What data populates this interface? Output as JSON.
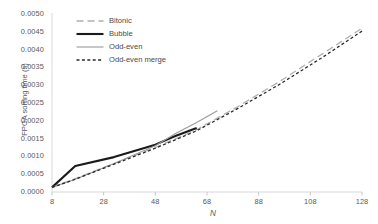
{
  "chart_data": {
    "type": "line",
    "title": "",
    "xlabel": "N",
    "ylabel": "FPGA sorting time (s)",
    "xlim": [
      8,
      128
    ],
    "ylim": [
      0.0,
      0.005
    ],
    "xticks": [
      8,
      28,
      48,
      68,
      88,
      108,
      128
    ],
    "xtick_labels": [
      "8",
      "28",
      "48",
      "68",
      "88",
      "108",
      "128"
    ],
    "yticks": [
      0.0,
      0.0005,
      0.001,
      0.0015,
      0.002,
      0.0025,
      0.003,
      0.0035,
      0.004,
      0.0045,
      0.005
    ],
    "ytick_labels": [
      "0.0000",
      "0.0005",
      "0.0010",
      "0.0015",
      "0.0020",
      "0.0025",
      "0.0030",
      "0.0035",
      "0.0040",
      "0.0045",
      "0.0050"
    ],
    "grid": false,
    "legend_position": "top-left-inside",
    "series": [
      {
        "name": "Bitonic",
        "style": "dashed",
        "color": "#b0b0b0",
        "width": 1.3,
        "x": [
          8,
          16,
          32,
          48,
          64,
          80,
          96,
          112,
          128
        ],
        "y": [
          0.00013,
          0.00035,
          0.0008,
          0.00125,
          0.00175,
          0.0024,
          0.0031,
          0.00385,
          0.0046
        ]
      },
      {
        "name": "Bubble",
        "style": "solid",
        "color": "#1a1a1a",
        "width": 2.1,
        "x": [
          8,
          17,
          32,
          48,
          56,
          64
        ],
        "y": [
          0.00013,
          0.00073,
          0.00098,
          0.00133,
          0.00158,
          0.0018
        ]
      },
      {
        "name": "Odd-even",
        "style": "solid",
        "color": "#9a9a9a",
        "width": 1.1,
        "x": [
          8,
          17,
          32,
          48,
          56,
          64,
          72
        ],
        "y": [
          0.00013,
          0.00036,
          0.0008,
          0.0013,
          0.00165,
          0.00195,
          0.00228
        ]
      },
      {
        "name": "Odd-even merge",
        "style": "dotted",
        "color": "#2a2a2a",
        "width": 1.3,
        "x": [
          8,
          16,
          32,
          48,
          64,
          80,
          96,
          112,
          128
        ],
        "y": [
          0.00013,
          0.00033,
          0.00078,
          0.00123,
          0.00172,
          0.00235,
          0.00302,
          0.00375,
          0.00452
        ]
      }
    ]
  },
  "axes": {
    "y_axis_line_color": "#d9d9d9",
    "x_axis_line_color": "#d9d9d9"
  }
}
